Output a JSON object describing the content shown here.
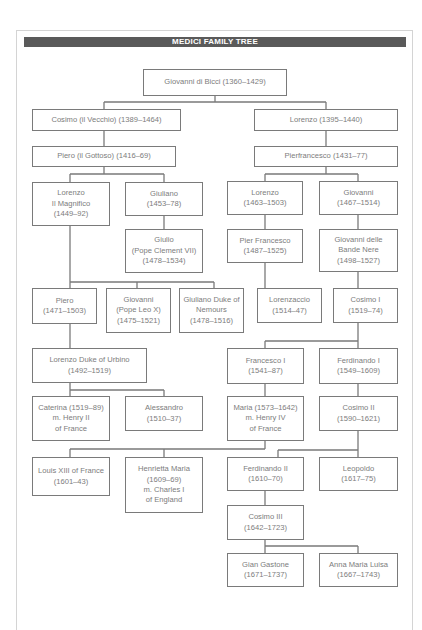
{
  "title": "MEDICI FAMILY TREE",
  "colors": {
    "header_bg": "#5a5a5a",
    "header_text": "#ffffff",
    "box_border": "#7a7a7a",
    "text": "#7c7c7c",
    "line": "#7a7a7a"
  },
  "nodes": {
    "giovanni_di_bicci": {
      "lines": [
        "Giovanni di Bicci (1360–1429)"
      ]
    },
    "cosimo_vecchio": {
      "lines": [
        "Cosimo (il Vecchio) (1389–1464)"
      ]
    },
    "lorenzo_1395": {
      "lines": [
        "Lorenzo (1395–1440)"
      ]
    },
    "piero_gottoso": {
      "lines": [
        "Piero (il Gottoso) (1416–69)"
      ]
    },
    "pierfrancesco": {
      "lines": [
        "Pierfrancesco (1431–77)"
      ]
    },
    "lorenzo_magnifico": {
      "lines": [
        "Lorenzo",
        "Il Magnifico",
        "(1449–92)"
      ]
    },
    "giuliano": {
      "lines": [
        "Giuliano",
        "(1453–78)"
      ]
    },
    "lorenzo_1463": {
      "lines": [
        "Lorenzo",
        "(1463–1503)"
      ]
    },
    "giovanni_1467": {
      "lines": [
        "Giovanni",
        "(1467–1514)"
      ]
    },
    "giulio": {
      "lines": [
        "Giulio",
        "(Pope Clement VII)",
        "(1478–1534)"
      ]
    },
    "pier_francesco": {
      "lines": [
        "Pier Francesco",
        "(1487–1525)"
      ]
    },
    "giovanni_bande_nere": {
      "lines": [
        "Giovanni delle",
        "Bande Nere",
        "(1498–1527)"
      ]
    },
    "piero_1471": {
      "lines": [
        "Piero",
        "(1471–1503)"
      ]
    },
    "giovanni_leo_x": {
      "lines": [
        "Giovanni",
        "(Pope Leo X)",
        "(1475–1521)"
      ]
    },
    "giuliano_nemours": {
      "lines": [
        "Giuliano Duke of",
        "Nemours",
        "(1478–1516)"
      ]
    },
    "lorenzaccio": {
      "lines": [
        "Lorenzaccio",
        "(1514–47)"
      ]
    },
    "cosimo_i": {
      "lines": [
        "Cosimo I",
        "(1519–74)"
      ]
    },
    "lorenzo_urbino": {
      "lines": [
        "Lorenzo Duke of Urbino",
        "(1492–1519)"
      ]
    },
    "francesco_i": {
      "lines": [
        "Francesco I",
        "(1541–87)"
      ]
    },
    "ferdinando_i": {
      "lines": [
        "Ferdinando I",
        "(1549–1609)"
      ]
    },
    "caterina": {
      "lines": [
        "Caterina (1519–89)",
        "m. Henry II",
        "of France"
      ]
    },
    "alessandro": {
      "lines": [
        "Alessandro",
        "(1510–37)"
      ]
    },
    "maria": {
      "lines": [
        "Maria (1573–1642)",
        "m. Henry IV",
        "of France"
      ]
    },
    "cosimo_ii": {
      "lines": [
        "Cosimo II",
        "(1590–1621)"
      ]
    },
    "louis_xiii": {
      "lines": [
        "Louis XIII of France",
        "(1601–43)"
      ]
    },
    "henrietta_maria": {
      "lines": [
        "Henrietta Maria",
        "(1609–69)",
        "m. Charles I",
        "of England"
      ]
    },
    "ferdinando_ii": {
      "lines": [
        "Ferdinando II",
        "(1610–70)"
      ]
    },
    "leopoldo": {
      "lines": [
        "Leopoldo",
        "(1617–75)"
      ]
    },
    "cosimo_iii": {
      "lines": [
        "Cosimo III",
        "(1642–1723)"
      ]
    },
    "gian_gastone": {
      "lines": [
        "Gian Gastone",
        "(1671–1737)"
      ]
    },
    "anna_maria_luisa": {
      "lines": [
        "Anna Maria Luisa",
        "(1667–1743)"
      ]
    }
  }
}
